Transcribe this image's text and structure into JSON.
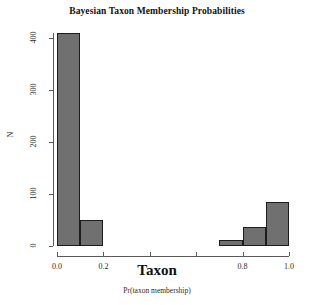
{
  "chart_data": {
    "type": "bar",
    "title": "Bayesian Taxon Membership Probabilities",
    "xlabel": "Taxon",
    "xsublabel": "Pr(taxon membership)",
    "ylabel": "N",
    "xlim": [
      0.0,
      1.0
    ],
    "ylim": [
      0,
      410
    ],
    "grid": false,
    "legend": "none",
    "bin_width": 0.1,
    "bar_color": "#707070",
    "bar_border_color": "#1c1c1c",
    "axis_color": "#5a5a5a",
    "bin_starts": [
      0.0,
      0.1,
      0.2,
      0.3,
      0.4,
      0.5,
      0.6,
      0.7,
      0.8,
      0.9
    ],
    "bin_ends": [
      0.1,
      0.2,
      0.3,
      0.4,
      0.5,
      0.6,
      0.7,
      0.8,
      0.9,
      1.0
    ],
    "categories": [
      "0.0-0.1",
      "0.1-0.2",
      "0.2-0.3",
      "0.3-0.4",
      "0.4-0.5",
      "0.5-0.6",
      "0.6-0.7",
      "0.7-0.8",
      "0.8-0.9",
      "0.9-1.0"
    ],
    "values": [
      410,
      51,
      0,
      0,
      0,
      0,
      0,
      12,
      36,
      85
    ],
    "x_ticks": [
      0.0,
      0.2,
      0.4,
      0.6,
      0.8,
      1.0
    ],
    "x_tick_labels": [
      "0.0",
      "0.2",
      "0.4",
      "0.6",
      "0.8",
      "1.0"
    ],
    "x_tick_labels_visible": [
      true,
      true,
      false,
      false,
      true,
      true
    ],
    "y_ticks": [
      0,
      100,
      200,
      300,
      400
    ],
    "y_tick_labels": [
      "0",
      "100",
      "200",
      "300",
      "400"
    ]
  }
}
